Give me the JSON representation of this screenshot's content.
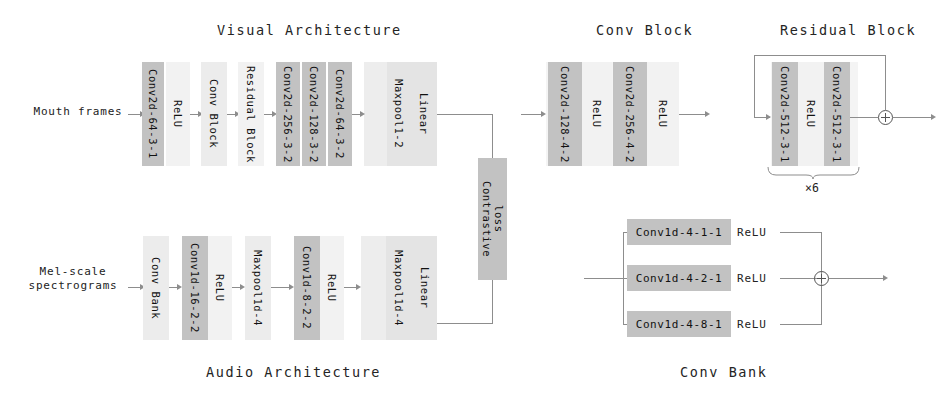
{
  "diagram": {
    "sections": {
      "visual_title": "Visual Architecture",
      "audio_title": "Audio Architecture",
      "conv_block_title": "Conv Block",
      "residual_block_title": "Residual Block",
      "conv_bank_title": "Conv Bank"
    },
    "inputs": {
      "visual": "Mouth frames",
      "audio_line1": "Mel-scale",
      "audio_line2": "spectrograms"
    },
    "visual_blocks": [
      {
        "label": "Conv2d-64-3-1",
        "shade": "dark"
      },
      {
        "label": "ReLU",
        "shade": "vlight"
      },
      {
        "label": "Conv Block",
        "shade": "light"
      },
      {
        "label": "Residual Block",
        "shade": "vlight"
      },
      {
        "label": "Conv2d-256-3-2",
        "shade": "dark"
      },
      {
        "label": "Conv2d-128-3-2",
        "shade": "dark"
      },
      {
        "label": "Conv2d-64-3-2",
        "shade": "dark"
      },
      {
        "label": "Maxpool1-2",
        "shade": "group"
      },
      {
        "label": "Linear",
        "shade": "group"
      }
    ],
    "audio_blocks": [
      {
        "label": "Conv Bank",
        "shade": "light"
      },
      {
        "label": "Conv1d-16-2-2",
        "shade": "dark"
      },
      {
        "label": "ReLU",
        "shade": "vlight"
      },
      {
        "label": "Maxpool1d-4",
        "shade": "light"
      },
      {
        "label": "Conv1d-8-2-2",
        "shade": "dark"
      },
      {
        "label": "ReLU",
        "shade": "vlight"
      },
      {
        "label": "Maxpool1d-4",
        "shade": "group"
      },
      {
        "label": "Linear",
        "shade": "group"
      }
    ],
    "loss": {
      "line1": "Contrastive",
      "line2": "loss"
    },
    "conv_block_blocks": [
      {
        "label": "Conv2d-128-4-2",
        "shade": "dark"
      },
      {
        "label": "ReLU",
        "shade": "vlight"
      },
      {
        "label": "Conv2d-256-4-2",
        "shade": "dark"
      },
      {
        "label": "ReLU",
        "shade": "vlight"
      }
    ],
    "residual_block_blocks": [
      {
        "label": "Conv2d-512-3-1",
        "shade": "dark"
      },
      {
        "label": "ReLU",
        "shade": "vlight"
      },
      {
        "label": "Conv2d-512-3-1",
        "shade": "dark"
      }
    ],
    "residual_repeat": "×6",
    "conv_bank_branches": [
      {
        "conv": "Conv1d-4-1-1",
        "act": "ReLU"
      },
      {
        "conv": "Conv1d-4-2-1",
        "act": "ReLU"
      },
      {
        "conv": "Conv1d-4-8-1",
        "act": "ReLU"
      }
    ],
    "colors": {
      "dark": "#c2c2c2",
      "light": "#ececec",
      "group": "#e4e4e4",
      "vlight": "#f2f2f2",
      "line": "#8d8d8d",
      "text": "#1a1a1a",
      "background": "#ffffff"
    }
  }
}
